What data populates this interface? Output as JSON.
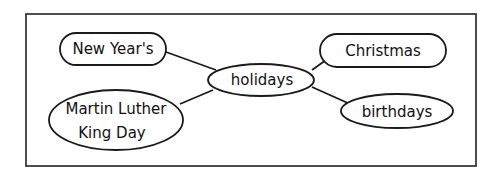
{
  "diagram": {
    "type": "concept-web",
    "center": {
      "label": "holidays"
    },
    "nodes": [
      {
        "id": "new-years",
        "label": "New Year's"
      },
      {
        "id": "mlk",
        "label_line1": "Martin Luther",
        "label_line2": "King Day"
      },
      {
        "id": "christmas",
        "label": "Christmas"
      },
      {
        "id": "birthdays",
        "label": "birthdays"
      }
    ],
    "edges": [
      [
        "holidays",
        "New Year's"
      ],
      [
        "holidays",
        "Martin Luther King Day"
      ],
      [
        "holidays",
        "Christmas"
      ],
      [
        "holidays",
        "birthdays"
      ]
    ],
    "colors": {
      "stroke": "#1a1a1a",
      "background": "#ffffff"
    }
  }
}
